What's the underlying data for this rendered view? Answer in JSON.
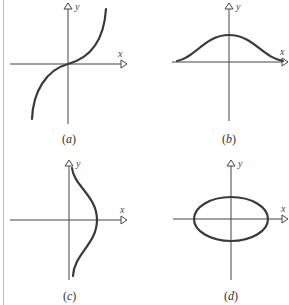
{
  "figure": {
    "panels": [
      {
        "id": "a",
        "caption_open": "(",
        "caption_letter": "a",
        "caption_close": ")",
        "x_label": "x",
        "y_label": "y",
        "curve": "odd-increasing-s-curve"
      },
      {
        "id": "b",
        "caption_open": "(",
        "caption_letter": "b",
        "caption_close": ")",
        "x_label": "x",
        "y_label": "y",
        "curve": "bell-curve"
      },
      {
        "id": "c",
        "caption_open": "(",
        "caption_letter": "c",
        "caption_close": ")",
        "x_label": "x",
        "y_label": "y",
        "curve": "sideways-bell-curve"
      },
      {
        "id": "d",
        "caption_open": "(",
        "caption_letter": "d",
        "caption_close": ")",
        "x_label": "x",
        "y_label": "y",
        "curve": "ellipse"
      }
    ]
  }
}
